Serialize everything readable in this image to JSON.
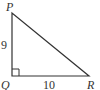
{
  "diagram": {
    "type": "right-triangle",
    "vertices": [
      {
        "name": "P",
        "label": "P"
      },
      {
        "name": "Q",
        "label": "Q"
      },
      {
        "name": "R",
        "label": "R"
      }
    ],
    "side_labels": {
      "PQ": "9",
      "QR": "10"
    },
    "right_angle_at": "Q",
    "stroke_color": "#333333"
  }
}
